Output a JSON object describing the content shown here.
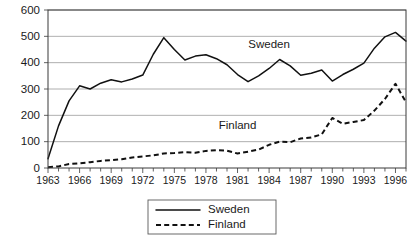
{
  "chart_data": {
    "type": "line",
    "title": "",
    "xlabel": "",
    "ylabel": "",
    "xlim": [
      1963,
      1997
    ],
    "ylim": [
      0,
      600
    ],
    "grid": true,
    "legend_position": "bottom-center",
    "yticks": [
      0,
      100,
      200,
      300,
      400,
      500,
      600
    ],
    "ytick_labels": [
      "0",
      "100",
      "200",
      "300",
      "400",
      "500",
      "600"
    ],
    "xticks": [
      1963,
      1966,
      1969,
      1972,
      1975,
      1978,
      1981,
      1984,
      1987,
      1990,
      1993,
      1996
    ],
    "xtick_labels": [
      "1963",
      "1966",
      "1969",
      "1972",
      "1975",
      "1978",
      "1981",
      "1984",
      "1987",
      "1990",
      "1993",
      "1996"
    ],
    "x": [
      1963,
      1964,
      1965,
      1966,
      1967,
      1968,
      1969,
      1970,
      1971,
      1972,
      1973,
      1974,
      1975,
      1976,
      1977,
      1978,
      1979,
      1980,
      1981,
      1982,
      1983,
      1984,
      1985,
      1986,
      1987,
      1988,
      1989,
      1990,
      1991,
      1992,
      1993,
      1994,
      1995,
      1996,
      1997
    ],
    "series": [
      {
        "name": "Sweden",
        "style": "solid",
        "color": "#111111",
        "values": [
          35,
          160,
          255,
          312,
          300,
          322,
          335,
          327,
          338,
          353,
          432,
          495,
          450,
          410,
          425,
          430,
          415,
          392,
          355,
          328,
          350,
          378,
          412,
          388,
          352,
          360,
          372,
          330,
          355,
          375,
          398,
          455,
          498,
          515,
          482
        ]
      },
      {
        "name": "Finland",
        "style": "dashed",
        "color": "#111111",
        "values": [
          3,
          6,
          15,
          18,
          22,
          27,
          30,
          33,
          40,
          44,
          48,
          55,
          57,
          60,
          58,
          65,
          68,
          66,
          55,
          62,
          70,
          88,
          100,
          98,
          112,
          116,
          128,
          190,
          168,
          175,
          182,
          218,
          262,
          320,
          250
        ]
      }
    ],
    "annotations": [
      {
        "text": "Sweden",
        "x": 1984,
        "y": 455
      },
      {
        "text": "Finland",
        "x": 1981,
        "y": 148
      }
    ],
    "legend": [
      {
        "label": "Sweden",
        "style": "solid"
      },
      {
        "label": "Finland",
        "style": "dashed"
      }
    ]
  }
}
